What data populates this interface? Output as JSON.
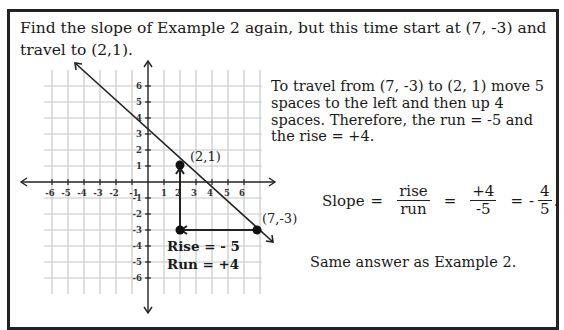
{
  "problem": {
    "intro_text": "Find the slope of Example 2 again, but this time start at (7, -3) and travel to (2,1)."
  },
  "explanation": {
    "text": "To travel from (7, -3) to (2, 1) move 5 spaces to the left and then up 4 spaces.  Therefore, the run = -5 and the rise = +4."
  },
  "slope_equation": {
    "label": "Slope",
    "eq1": "=",
    "frac1_num": "rise",
    "frac1_den": "run",
    "eq2": "=",
    "frac2_num": "+4",
    "frac2_den": "-5",
    "eq3": "=",
    "sign": "-",
    "frac3_num": "4",
    "frac3_den": "5",
    "period": "."
  },
  "conclusion": {
    "text": "Same answer as Example 2."
  },
  "graph": {
    "x_ticks": [
      "-6",
      "-5",
      "-4",
      "-3",
      "-2",
      "-1",
      "1",
      "2",
      "3",
      "4",
      "5",
      "6"
    ],
    "y_ticks": [
      "6",
      "5",
      "4",
      "3",
      "2",
      "1",
      "-1",
      "-2",
      "-3",
      "-4",
      "-5",
      "-6"
    ],
    "points": [
      {
        "label": "(2,1)",
        "x": 2,
        "y": 1
      },
      {
        "label": "(7,-3)",
        "x": 7,
        "y": -3
      },
      {
        "label": "",
        "x": 2,
        "y": -3
      }
    ],
    "rise_label": "Rise = - 5",
    "run_label": "Run = +4"
  }
}
